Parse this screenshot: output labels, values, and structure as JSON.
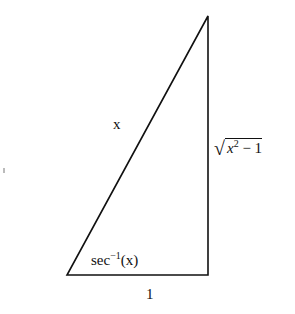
{
  "diagram": {
    "type": "right-triangle",
    "vertices": {
      "angle_vertex": [
        67,
        275
      ],
      "right_angle_vertex": [
        208,
        275
      ],
      "top_vertex": [
        208,
        16
      ]
    },
    "labels": {
      "hypotenuse": "x",
      "angle_prefix": "sec",
      "angle_exponent": "−1",
      "angle_suffix": "(x)",
      "adjacent_side": "1",
      "opposite_var": "x",
      "opposite_exponent": "2",
      "opposite_rest": " − 1"
    },
    "stroke_color": "#111111",
    "background": "#ffffff"
  }
}
